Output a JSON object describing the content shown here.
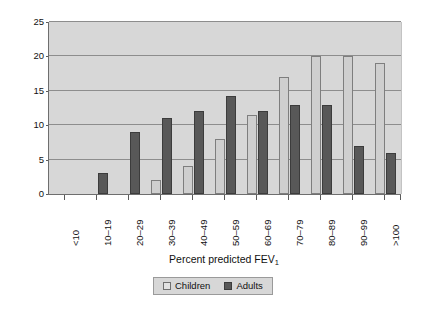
{
  "chart_data": {
    "type": "bar",
    "title": "",
    "xlabel": "Percent predicted FEV",
    "xlabel_sub": "1",
    "ylabel": "Percent of patients",
    "categories": [
      "<10",
      "10–19",
      "20–29",
      "30–39",
      "40–49",
      "50–59",
      "60–69",
      "70–79",
      "80–89",
      "90–99",
      ">100"
    ],
    "series": [
      {
        "name": "Children",
        "color": "#cfcfcf",
        "values": [
          0,
          0,
          0,
          2,
          4,
          8,
          11.5,
          17,
          20,
          20,
          19
        ]
      },
      {
        "name": "Adults",
        "color": "#585858",
        "values": [
          0,
          3,
          9,
          11,
          12,
          14.3,
          12,
          13,
          13,
          7,
          6
        ]
      }
    ],
    "ylim": [
      0,
      25
    ],
    "yticks": [
      0,
      5,
      10,
      15,
      20,
      25
    ],
    "grid": true,
    "grid_axis": "y",
    "legend_position": "bottom-center",
    "plot_background": "#d7d7d7",
    "gridline_color": "#8d8d8d"
  },
  "legend": {
    "items": [
      {
        "label": "Children"
      },
      {
        "label": "Adults"
      }
    ]
  }
}
